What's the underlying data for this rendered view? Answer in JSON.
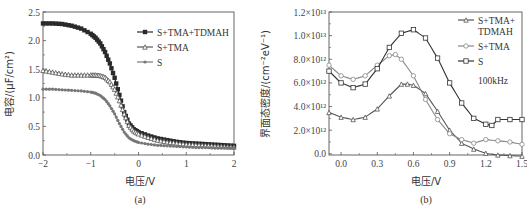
{
  "chart_data": [
    {
      "id": "a",
      "type": "line",
      "caption": "(a)",
      "xlabel": "电压/V",
      "ylabel": "电容/(μF/cm²)",
      "xlim": [
        -2,
        2
      ],
      "ylim": [
        0,
        2.5
      ],
      "xticks": [
        -2,
        -1,
        0,
        1,
        2
      ],
      "xtick_labels": [
        "−2",
        "−1",
        "0",
        "1",
        "2"
      ],
      "yticks": [
        0,
        0.5,
        1.0,
        1.5,
        2.0,
        2.5
      ],
      "ytick_labels": [
        "0.0",
        "0.5",
        "1.0",
        "1.5",
        "2.0",
        "2.5"
      ],
      "grid": false,
      "legend_position": "upper right",
      "series": [
        {
          "name": "S+TMA+TDMAH",
          "marker": "square",
          "color": "#2a2a2a",
          "x": [
            -2.0,
            -1.8,
            -1.6,
            -1.4,
            -1.2,
            -1.0,
            -0.9,
            -0.8,
            -0.7,
            -0.6,
            -0.5,
            -0.4,
            -0.3,
            -0.2,
            -0.1,
            0.0,
            0.2,
            0.4,
            0.6,
            0.8,
            1.0,
            1.2,
            1.4,
            1.6,
            1.8,
            2.0
          ],
          "values": [
            2.3,
            2.3,
            2.29,
            2.26,
            2.21,
            2.12,
            2.05,
            1.95,
            1.8,
            1.6,
            1.35,
            1.05,
            0.75,
            0.55,
            0.45,
            0.4,
            0.34,
            0.29,
            0.26,
            0.23,
            0.21,
            0.2,
            0.19,
            0.18,
            0.17,
            0.16
          ]
        },
        {
          "name": "S+TMA",
          "marker": "triangle",
          "color": "#555555",
          "x": [
            -2.0,
            -1.8,
            -1.6,
            -1.4,
            -1.2,
            -1.0,
            -0.9,
            -0.8,
            -0.7,
            -0.6,
            -0.5,
            -0.4,
            -0.3,
            -0.2,
            -0.1,
            0.0,
            0.2,
            0.4,
            0.6,
            0.8,
            1.0,
            1.2,
            1.4,
            1.6,
            1.8,
            2.0
          ],
          "values": [
            1.48,
            1.45,
            1.42,
            1.4,
            1.4,
            1.4,
            1.4,
            1.39,
            1.36,
            1.28,
            1.15,
            0.95,
            0.72,
            0.52,
            0.42,
            0.37,
            0.31,
            0.26,
            0.23,
            0.21,
            0.19,
            0.18,
            0.17,
            0.16,
            0.15,
            0.14
          ]
        },
        {
          "name": "S",
          "marker": "star",
          "color": "#777777",
          "x": [
            -2.0,
            -1.8,
            -1.6,
            -1.4,
            -1.2,
            -1.0,
            -0.9,
            -0.8,
            -0.7,
            -0.6,
            -0.5,
            -0.4,
            -0.3,
            -0.2,
            -0.1,
            0.0,
            0.2,
            0.4,
            0.6,
            0.8,
            1.0,
            1.2,
            1.4,
            1.6,
            1.8,
            2.0
          ],
          "values": [
            1.15,
            1.15,
            1.14,
            1.13,
            1.12,
            1.1,
            1.08,
            1.04,
            0.97,
            0.86,
            0.72,
            0.55,
            0.4,
            0.3,
            0.25,
            0.22,
            0.19,
            0.17,
            0.16,
            0.15,
            0.14,
            0.13,
            0.13,
            0.12,
            0.12,
            0.12
          ]
        }
      ]
    },
    {
      "id": "b",
      "type": "line",
      "caption": "(b)",
      "xlabel": "电压/V",
      "ylabel": "界面态密度/(cm⁻²eV⁻¹)",
      "xlim": [
        -0.1,
        1.5
      ],
      "ylim": [
        -100000000000.0,
        12000000000000.0
      ],
      "xticks": [
        0.0,
        0.3,
        0.6,
        0.9,
        1.2,
        1.5
      ],
      "xtick_labels": [
        "0.0",
        "0.3",
        "0.6",
        "0.9",
        "1.2",
        "1.5"
      ],
      "yticks": [
        0,
        2000000000000.0,
        4000000000000.0,
        6000000000000.0,
        8000000000000.0,
        10000000000000.0,
        12000000000000.0
      ],
      "ytick_labels": [
        "0.0",
        "2.0×10¹²",
        "4.0×10¹²",
        "6.0×10¹²",
        "8.0×10¹²",
        "1.0×10¹³",
        "1.2×10¹³"
      ],
      "grid": false,
      "legend_position": "upper right",
      "annotation": "100kHz",
      "series": [
        {
          "name": "S+TMA+TDMAH",
          "legend_lines": [
            "S+TMA+",
            "TDMAH"
          ],
          "marker": "triangle",
          "color": "#555555",
          "x": [
            -0.1,
            0.0,
            0.1,
            0.2,
            0.3,
            0.4,
            0.5,
            0.55,
            0.6,
            0.7,
            0.8,
            0.9,
            1.0,
            1.1,
            1.2,
            1.3,
            1.4,
            1.5
          ],
          "values": [
            3500000000000.0,
            3100000000000.0,
            2900000000000.0,
            3100000000000.0,
            3800000000000.0,
            4900000000000.0,
            5900000000000.0,
            5900000000000.0,
            5800000000000.0,
            5100000000000.0,
            3600000000000.0,
            2000000000000.0,
            900000000000.0,
            400000000000.0,
            50000000000.0,
            -100000000000.0,
            -150000000000.0,
            -200000000000.0
          ]
        },
        {
          "name": "S+TMA",
          "legend_lines": [
            "S+TMA"
          ],
          "marker": "circle",
          "color": "#888888",
          "x": [
            -0.1,
            0.0,
            0.1,
            0.2,
            0.3,
            0.4,
            0.45,
            0.5,
            0.6,
            0.7,
            0.8,
            0.9,
            1.0,
            1.1,
            1.2,
            1.3,
            1.4,
            1.5
          ],
          "values": [
            7500000000000.0,
            6600000000000.0,
            6300000000000.0,
            6600000000000.0,
            7500000000000.0,
            8300000000000.0,
            8400000000000.0,
            8000000000000.0,
            6600000000000.0,
            4600000000000.0,
            2900000000000.0,
            1700000000000.0,
            1200000000000.0,
            900000000000.0,
            1200000000000.0,
            1100000000000.0,
            1000000000000.0,
            800000000000.0
          ]
        },
        {
          "name": "S",
          "legend_lines": [
            "S"
          ],
          "marker": "square-open",
          "color": "#333333",
          "x": [
            -0.1,
            0.0,
            0.1,
            0.2,
            0.3,
            0.4,
            0.5,
            0.6,
            0.7,
            0.8,
            0.9,
            1.0,
            1.1,
            1.2,
            1.25,
            1.3,
            1.4,
            1.5
          ],
          "values": [
            7000000000000.0,
            6000000000000.0,
            5600000000000.0,
            5900000000000.0,
            7200000000000.0,
            9000000000000.0,
            10200000000000.0,
            10500000000000.0,
            9800000000000.0,
            8100000000000.0,
            6000000000000.0,
            4300000000000.0,
            3000000000000.0,
            2500000000000.0,
            2400000000000.0,
            2900000000000.0,
            2900000000000.0,
            2900000000000.0
          ]
        }
      ]
    }
  ]
}
